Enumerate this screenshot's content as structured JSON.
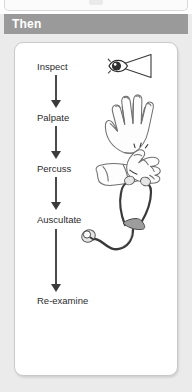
{
  "prev_panel": {
    "visible": true
  },
  "header": {
    "title": "Then",
    "bar_color": "#9a9a9a",
    "text_color": "#ffffff"
  },
  "panel": {
    "background": "#ffffff",
    "border_color": "#c9c9c9",
    "outer_background": "#ebebeb"
  },
  "flow": {
    "steps": [
      {
        "label": "Inspect",
        "icon": "eye-vision-cone-icon"
      },
      {
        "label": "Palpate",
        "icon": "open-hand-icon"
      },
      {
        "label": "Percuss",
        "icon": "percussing-hands-icon"
      },
      {
        "label": "Auscultate",
        "icon": "stethoscope-icon"
      },
      {
        "label": "Re-examine",
        "icon": "none"
      }
    ],
    "connectors": [
      {
        "name": "arrow-inspect-to-palpate",
        "direction": "down"
      },
      {
        "name": "arrow-palpate-to-percuss",
        "direction": "down"
      },
      {
        "name": "arrow-percuss-to-auscultate",
        "direction": "down"
      },
      {
        "name": "arrow-auscultate-to-reexamine",
        "direction": "down"
      }
    ],
    "arrow_color": "#3b3b3b",
    "label_color": "#2b2b2b"
  }
}
